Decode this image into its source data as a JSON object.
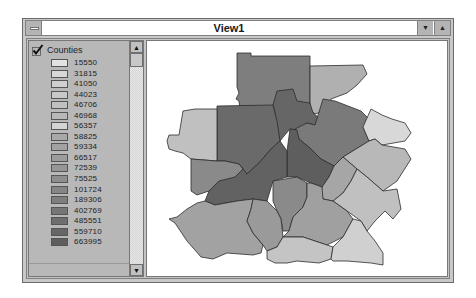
{
  "window": {
    "title": "View1",
    "system_menu_icon": "system-menu-icon",
    "minimize_icon": "minimize-arrow-down-icon",
    "maximize_icon": "maximize-arrow-up-icon",
    "minimize_glyph": "▼",
    "maximize_glyph": "▲"
  },
  "toc": {
    "theme": {
      "name": "Counties",
      "visible": true,
      "check_icon": "checkmark-icon"
    },
    "legend": [
      {
        "label": "15550",
        "color": "#e2e2e2"
      },
      {
        "label": "31815",
        "color": "#d8d8d8"
      },
      {
        "label": "41050",
        "color": "#d0d0d0"
      },
      {
        "label": "44023",
        "color": "#c8c8c8"
      },
      {
        "label": "46706",
        "color": "#c0c0c0"
      },
      {
        "label": "46968",
        "color": "#b8b8b8"
      },
      {
        "label": "56357",
        "color": "#d4d4d4"
      },
      {
        "label": "58825",
        "color": "#a8a8a8"
      },
      {
        "label": "59334",
        "color": "#a2a2a2"
      },
      {
        "label": "66517",
        "color": "#9c9c9c"
      },
      {
        "label": "72539",
        "color": "#969696"
      },
      {
        "label": "75525",
        "color": "#8e8e8e"
      },
      {
        "label": "101724",
        "color": "#868686"
      },
      {
        "label": "189306",
        "color": "#7e7e7e"
      },
      {
        "label": "402769",
        "color": "#767676"
      },
      {
        "label": "485551",
        "color": "#6e6e6e"
      },
      {
        "label": "559710",
        "color": "#666666"
      },
      {
        "label": "663995",
        "color": "#5e5e5e"
      }
    ],
    "scroll_up_glyph": "▲",
    "scroll_down_glyph": "▼"
  },
  "map": {
    "layer": "Counties",
    "counties": [
      {
        "name": "north-center",
        "fill": "#7e7e7e",
        "points": "90,12 104,12 104,15 163,15 163,68 93,68 92,60 89,58 92,52 90,46"
      },
      {
        "name": "north-east-top",
        "fill": "#b0b0b0",
        "points": "163,25 216,24 220,33 210,44 200,52 184,58 177,70 168,73 163,68"
      },
      {
        "name": "center-north",
        "fill": "#666666",
        "points": "130,50 146,48 150,60 163,62 166,72 176,80 168,84 160,82 150,89 143,88 137,95 133,100 130,86 128,72 126,64"
      },
      {
        "name": "northwest",
        "fill": "#6a6a6a",
        "points": "70,65 126,64 130,80 133,100 124,108 112,122 100,133 92,123 78,120 70,120"
      },
      {
        "name": "east-north",
        "fill": "#7a7a7a",
        "points": "176,58 188,60 214,70 224,80 216,86 222,100 196,116 187,125 174,118 164,108 152,98 148,88 160,82 168,84"
      },
      {
        "name": "far-northeast",
        "fill": "#d8d8d8",
        "points": "224,68 235,74 245,78 258,82 264,92 258,100 235,104 228,98 222,100 216,86"
      },
      {
        "name": "west",
        "fill": "#c0c0c0",
        "points": "36,70 48,68 70,68 70,120 44,118 36,112 28,110 22,108 20,100 22,94 32,94 34,82"
      },
      {
        "name": "east",
        "fill": "#b8b8b8",
        "points": "196,116 222,100 228,98 235,104 258,108 264,118 250,140 236,150 220,136 210,128"
      },
      {
        "name": "center-east",
        "fill": "#5e5e5e",
        "points": "143,88 150,89 152,98 164,108 174,118 187,125 182,136 175,146 164,142 150,136 140,136 140,110"
      },
      {
        "name": "central-sw",
        "fill": "#626262",
        "points": "133,100 140,110 140,136 126,140 120,160 106,158 90,160 68,164 58,160 62,150 72,140 92,123 100,133 112,122 124,108"
      },
      {
        "name": "west-central",
        "fill": "#8a8a8a",
        "points": "44,118 70,120 78,120 92,123 96,128 88,136 72,140 62,150 50,154 44,150"
      },
      {
        "name": "east-central",
        "fill": "#a6a6a6",
        "points": "187,125 196,116 210,128 204,140 196,152 186,160 176,158 174,150 175,146 182,136"
      },
      {
        "name": "southeast-mid",
        "fill": "#c0c0c0",
        "points": "210,128 220,136 236,150 250,148 254,168 246,178 238,170 228,180 220,190 214,180 200,170 186,160 196,152 204,140"
      },
      {
        "name": "center-south",
        "fill": "#8a8a8a",
        "points": "126,140 150,136 160,142 160,156 156,166 146,176 142,190 136,190 134,178 130,170 126,160"
      },
      {
        "name": "south-east-mid",
        "fill": "#a0a0a0",
        "points": "160,142 164,142 175,146 176,158 186,160 200,170 206,178 196,196 180,204 168,200 156,196 136,196 142,190 146,176 156,166 160,156"
      },
      {
        "name": "southwest",
        "fill": "#a2a2a2",
        "points": "58,160 68,164 90,160 106,158 104,168 100,180 106,192 116,204 114,212 106,214 80,212 66,218 54,216 40,200 28,182 22,178 30,176 40,168 50,162"
      },
      {
        "name": "south-center",
        "fill": "#9a9a9a",
        "points": "106,158 120,160 130,170 134,178 136,196 130,206 120,210 116,204 106,192 100,180 104,168"
      },
      {
        "name": "south",
        "fill": "#c4c4c4",
        "points": "130,206 136,196 156,196 168,200 180,204 186,206 184,218 172,222 150,220 140,222 128,222 120,218 120,210"
      },
      {
        "name": "far-southeast",
        "fill": "#d0d0d0",
        "points": "196,196 206,178 214,180 220,190 228,200 236,212 236,224 224,222 200,220 186,220 184,218 186,206"
      }
    ]
  }
}
